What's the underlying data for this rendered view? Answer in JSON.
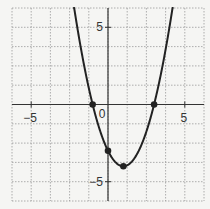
{
  "chart_data": {
    "type": "line",
    "title": "",
    "xlabel": "",
    "ylabel": "",
    "function": "y = x^2 - 2x - 3",
    "xlim": [
      -6.25,
      6.25
    ],
    "ylim": [
      -6.25,
      6.25
    ],
    "grid": true,
    "grid_step": 1.25,
    "x_tick_labels": [
      {
        "value": -5,
        "label": "−5"
      },
      {
        "value": 0,
        "label": "0"
      },
      {
        "value": 5,
        "label": "5"
      }
    ],
    "y_tick_labels": [
      {
        "value": 5,
        "label": "5"
      },
      {
        "value": -5,
        "label": "−5"
      }
    ],
    "series": [
      {
        "name": "parabola",
        "color": "#222222",
        "coefficients": {
          "a": 1,
          "b": -2,
          "c": -3
        }
      }
    ],
    "marked_points": [
      {
        "x": -1,
        "y": 0
      },
      {
        "x": 0,
        "y": -3
      },
      {
        "x": 1,
        "y": -4
      },
      {
        "x": 3,
        "y": 0
      }
    ]
  },
  "colors": {
    "background": "#f5f5f3",
    "grid": "#9a9a9a",
    "axis": "#333333",
    "curve": "#222222"
  }
}
